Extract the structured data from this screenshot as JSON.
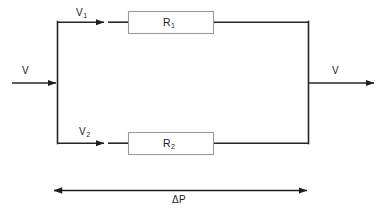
{
  "diagram": {
    "type": "circuit-schematic",
    "colors": {
      "wire": "#262626",
      "resistor_border": "#999999",
      "resistor_fill": "#ffffff",
      "text": "#1a1a1a",
      "background": "#ffffff"
    },
    "labels": {
      "input_flow": "V",
      "output_flow": "V",
      "branch_top_flow": "V",
      "branch_top_flow_sub": "1",
      "branch_bottom_flow": "V",
      "branch_bottom_flow_sub": "2",
      "resistor_top": "R",
      "resistor_top_sub": "1",
      "resistor_bottom": "R",
      "resistor_bottom_sub": "2",
      "dimension": "ΔP"
    },
    "components": [
      {
        "name": "resistor-top",
        "label": "R₁",
        "branch": "top"
      },
      {
        "name": "resistor-bottom",
        "label": "R₂",
        "branch": "bottom"
      }
    ],
    "flows": [
      {
        "name": "inlet-flow",
        "label": "V",
        "direction": "right"
      },
      {
        "name": "top-branch-flow",
        "label": "V₁",
        "direction": "right"
      },
      {
        "name": "bottom-branch-flow",
        "label": "V₂",
        "direction": "right"
      },
      {
        "name": "outlet-flow",
        "label": "V",
        "direction": "right"
      }
    ],
    "dimension_line": {
      "name": "pressure-drop-dimension",
      "label": "ΔP",
      "arrow_style": "double-headed"
    }
  }
}
